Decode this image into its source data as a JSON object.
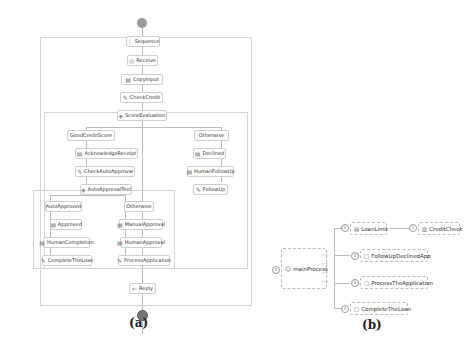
{
  "diagram_a": {
    "caption": "(a)",
    "nodes": {
      "sequence": "Sequence",
      "receive": "Receive",
      "copyinput": "CopyInput",
      "checkcredit": "CheckCredit",
      "scoreevaluation": "ScoreEvaluation",
      "goodcreditscore": "GoodCreditScore",
      "otherwise1": "Otherwise",
      "acknowledgereceipt": "AcknowledgeReceipt",
      "checkautoapproval": "CheckAutoApproval",
      "autoapprovaltest": "AutoApprovalTest",
      "declined": "Declined",
      "humanfollowup": "HumanFollowUp",
      "followup": "FollowUp",
      "autoapproved": "AutoApproved",
      "otherwise2": "Otherwise",
      "approved": "Approved",
      "manualapproval": "ManualApproval",
      "humancompletion": "HumanCompletion",
      "humanapproval": "HumanApproval",
      "completetheloan": "CompleteTheLoan",
      "processapplication": "ProcessApplication",
      "reply": "Reply"
    }
  },
  "diagram_b": {
    "caption": "(b)",
    "root": "mainProcess",
    "children": [
      "LoanLimit",
      "FollowUpDeclinedApp",
      "ProcessTheApplication",
      "CompleteTheLoan"
    ],
    "grandchild": "CreditCheck",
    "pin_label": "1"
  }
}
